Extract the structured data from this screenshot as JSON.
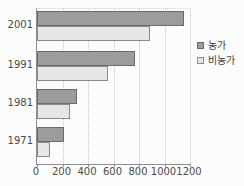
{
  "chart_data": {
    "type": "bar",
    "orientation": "horizontal",
    "title": "",
    "xlabel": "",
    "ylabel": "",
    "categories": [
      "2001",
      "1991",
      "1981",
      "1971"
    ],
    "series": [
      {
        "name": "농가",
        "key": "farm",
        "color": "#9c9c9c",
        "border_color": "#6a6a6a",
        "values": [
          1150,
          770,
          310,
          210
        ]
      },
      {
        "name": "비농가",
        "key": "nonfarm",
        "color": "#e6e6e6",
        "border_color": "#8a8a8a",
        "values": [
          890,
          560,
          260,
          100
        ]
      }
    ],
    "xlim": [
      0,
      1200
    ],
    "x_ticks": [
      0,
      200,
      400,
      600,
      800,
      1000,
      1200
    ],
    "grid": "vertical-dotted",
    "legend_position": "right",
    "legend_items": [
      "농가",
      "비농가"
    ]
  },
  "colors": {
    "background": "#fcfcfc",
    "axis": "#8f8f8f",
    "gridline": "#c2c2c2",
    "text": "#4b4b4b"
  }
}
